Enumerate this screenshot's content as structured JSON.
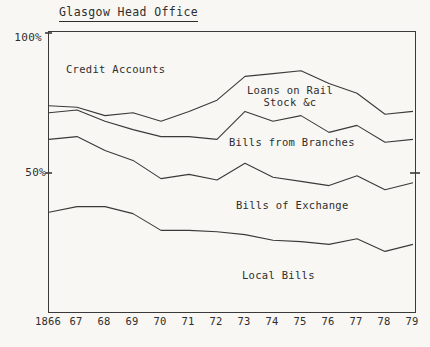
{
  "title": "Glasgow Head Office",
  "colors": {
    "ink": "#3a3a3a",
    "paper": "#f8f7f3"
  },
  "y_axis": {
    "top_label": "100%",
    "mid_label": "50%"
  },
  "x_axis": {
    "labels": [
      "1866",
      "67",
      "68",
      "69",
      "70",
      "71",
      "72",
      "73",
      "74",
      "75",
      "76",
      "77",
      "78",
      "79"
    ]
  },
  "area_labels": {
    "credit_accounts": "Credit Accounts",
    "loans_on_rail_line1": "Loans on Rail",
    "loans_on_rail_line2": "Stock &c",
    "bills_from_branches": "Bills from Branches",
    "bills_of_exchange": "Bills of Exchange",
    "local_bills": "Local Bills"
  },
  "chart_data": {
    "type": "area",
    "stacked_percentage": true,
    "title": "Glasgow Head Office",
    "x": [
      1866,
      1867,
      1868,
      1869,
      1870,
      1871,
      1872,
      1873,
      1874,
      1875,
      1876,
      1877,
      1878,
      1879
    ],
    "x_tick_labels": [
      "1866",
      "67",
      "68",
      "69",
      "70",
      "71",
      "72",
      "73",
      "74",
      "75",
      "76",
      "77",
      "78",
      "79"
    ],
    "ylim": [
      0,
      100
    ],
    "y_ticks": [
      {
        "value": 100,
        "label": "100%"
      },
      {
        "value": 50,
        "label": "50%"
      }
    ],
    "grid": false,
    "legend": "labels drawn inside bands",
    "bands_bottom_to_top": [
      "Local Bills",
      "Bills of Exchange",
      "Bills from Branches",
      "Loans on Rail Stock &c",
      "Credit Accounts"
    ],
    "cumulative_boundaries": [
      {
        "name": "Local Bills top",
        "values": [
          36,
          38,
          38,
          35.5,
          29.5,
          29.5,
          29,
          28,
          26,
          25.5,
          24.5,
          26.5,
          22,
          24.5
        ]
      },
      {
        "name": "Bills of Exchange top",
        "values": [
          62,
          63,
          58,
          54.5,
          48,
          49.5,
          47.5,
          53.5,
          48.5,
          47,
          45.5,
          49,
          44,
          46.5
        ]
      },
      {
        "name": "Bills from Branches top",
        "values": [
          71.5,
          72.5,
          68.5,
          65.5,
          63,
          63,
          62,
          72,
          68.5,
          70.5,
          64.5,
          67,
          61,
          62
        ]
      },
      {
        "name": "Loans on Rail Stock &c top",
        "values": [
          74,
          73.5,
          70.5,
          71.5,
          68.5,
          72,
          76,
          84.5,
          85.5,
          86.5,
          82,
          78.5,
          71,
          72
        ]
      }
    ],
    "top_of_chart_band": "Credit Accounts (up to 100%)"
  }
}
